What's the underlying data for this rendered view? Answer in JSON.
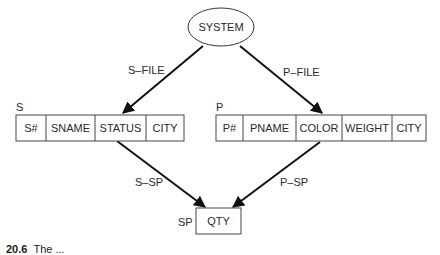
{
  "root": {
    "label": "SYSTEM"
  },
  "edges": [
    {
      "label": "S–FILE",
      "from": "SYSTEM",
      "to": "S"
    },
    {
      "label": "P–FILE",
      "from": "SYSTEM",
      "to": "P"
    },
    {
      "label": "S–SP",
      "from": "S",
      "to": "SP"
    },
    {
      "label": "P–SP",
      "from": "P",
      "to": "SP"
    }
  ],
  "records": {
    "S": {
      "name": "S",
      "fields": [
        "S#",
        "SNAME",
        "STATUS",
        "CITY"
      ]
    },
    "P": {
      "name": "P",
      "fields": [
        "P#",
        "PNAME",
        "COLOR",
        "WEIGHT",
        "CITY"
      ]
    },
    "SP": {
      "name": "SP",
      "fields": [
        "QTY"
      ]
    }
  },
  "caption": {
    "number": "20.6",
    "text": "The ..."
  },
  "colors": {
    "stroke": "#222222",
    "background": "#ffffff"
  }
}
